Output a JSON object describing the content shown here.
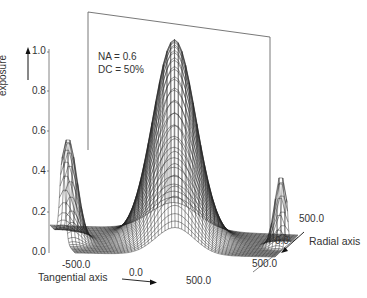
{
  "chart_data": {
    "type": "surface3d",
    "title": "",
    "annotation": [
      "NA = 0.6",
      "DC = 50%"
    ],
    "z_axis": {
      "label": "exposure",
      "ticks": [
        "0.0",
        "0.2",
        "0.4",
        "0.6",
        "0.8",
        "1.0"
      ],
      "range": [
        0.0,
        1.0
      ]
    },
    "x_axis": {
      "label": "Tangential axis",
      "ticks": [
        "-500.0",
        "0.0",
        "500.0"
      ],
      "range": [
        -500.0,
        500.0
      ]
    },
    "y_axis": {
      "label": "Radial axis",
      "ticks": [
        "500.0",
        "0.0",
        "500.0"
      ],
      "range": [
        -500.0,
        500.0
      ]
    },
    "surface_features": [
      {
        "name": "central peak",
        "tangential": 0.0,
        "radial": 0.0,
        "exposure": 1.0
      },
      {
        "name": "left side lobe",
        "tangential": -500.0,
        "radial": 0.0,
        "exposure": 0.5
      },
      {
        "name": "right side lobe",
        "tangential": 500.0,
        "radial": 0.0,
        "exposure": 0.35
      },
      {
        "name": "baseline",
        "exposure": 0.0
      }
    ],
    "grid": "wireframe mesh",
    "line_color": "#222222",
    "background": "#ffffff"
  },
  "labels": {
    "z_ticks": [
      "1.0",
      "0.8",
      "0.6",
      "0.4",
      "0.2",
      "0.0"
    ],
    "z_title": "exposure",
    "na": "NA = 0.6",
    "dc": "DC = 50%",
    "x_tick_neg": "-500.0",
    "x_tick_zero": "0.0",
    "x_tick_pos": "500.0",
    "x_title": "Tangential axis",
    "y_tick_far": "500.0",
    "y_tick_zero": "0.0",
    "y_tick_near": "500.0",
    "y_title": "Radial axis"
  }
}
